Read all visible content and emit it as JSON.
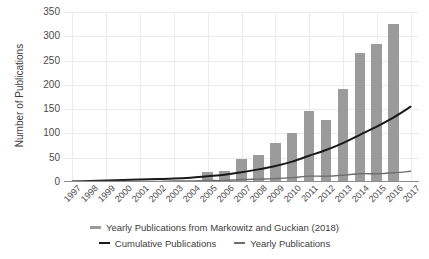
{
  "chart_data": {
    "type": "bar",
    "title": "",
    "xlabel": "",
    "ylabel": "Number of Publications",
    "ylim": [
      0,
      350
    ],
    "yticks": [
      0,
      50,
      100,
      150,
      200,
      250,
      300,
      350
    ],
    "grid": true,
    "legend_position": "bottom",
    "categories": [
      "1997",
      "1998",
      "1999",
      "2000",
      "2001",
      "2002",
      "2003",
      "2004",
      "2005",
      "2006",
      "2007",
      "2008",
      "2009",
      "2010",
      "2011",
      "2012",
      "2013",
      "2014",
      "2015",
      "2016",
      "2017"
    ],
    "series": [
      {
        "name": "Yearly Publications from Markowitz and Guckian (2018)",
        "type": "bar",
        "color": "#9b9b9b",
        "values": [
          0,
          0,
          0,
          0,
          0,
          0,
          0,
          2,
          21,
          23,
          47,
          55,
          80,
          101,
          146,
          128,
          191,
          265,
          285,
          325,
          0
        ]
      },
      {
        "name": "Cumulative Publications",
        "type": "line",
        "color": "#1a1a1a",
        "values": [
          1,
          2,
          3,
          4,
          5,
          6,
          7,
          9,
          12,
          15,
          20,
          26,
          33,
          42,
          54,
          66,
          80,
          97,
          114,
          133,
          155
        ]
      },
      {
        "name": "Yearly Publications",
        "type": "line",
        "color": "#6e6e6e",
        "values": [
          1,
          1,
          1,
          1,
          1,
          1,
          2,
          2,
          3,
          3,
          5,
          6,
          7,
          9,
          12,
          12,
          14,
          17,
          17,
          19,
          22
        ]
      }
    ],
    "legend": [
      {
        "label": "Yearly Publications from Markowitz and Guckian (2018)",
        "marker": "bar-swatch",
        "color": "#9b9b9b"
      },
      {
        "label": "Cumulative Publications",
        "marker": "line-swatch",
        "color": "#1a1a1a"
      },
      {
        "label": "Yearly Publications",
        "marker": "line-swatch",
        "color": "#6e6e6e"
      }
    ]
  }
}
